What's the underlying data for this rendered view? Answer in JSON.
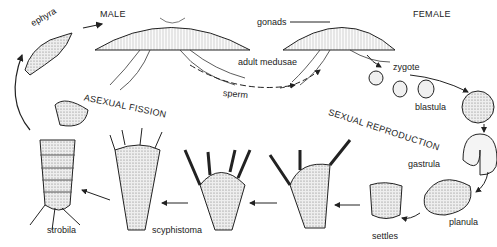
{
  "diagram": {
    "labels": {
      "male": "MALE",
      "female": "FEMALE",
      "gonads": "gonads",
      "adult_medusae": "adult medusae",
      "sperm": "sperm",
      "zygote": "zygote",
      "blastula": "blastula",
      "gastrula": "gastrula",
      "planula": "planula",
      "settles": "settles",
      "scyphistoma": "scyphistoma",
      "strobila": "strobila",
      "ephyra": "ephyra",
      "asexual_fission": "ASEXUAL FISSION",
      "sexual_reproduction": "SEXUAL REPRODUCTION"
    },
    "colors": {
      "ink": "#222222",
      "fill": "#d9d9d9",
      "background": "#ffffff"
    }
  }
}
